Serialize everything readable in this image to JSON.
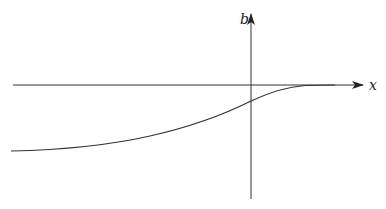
{
  "figure": {
    "axes": {
      "x_label": "x",
      "y_label": "b"
    },
    "curve": {
      "description": "monotonic increasing curve approaching zero from below as x increases",
      "color": "#333333"
    },
    "colors": {
      "line": "#333333",
      "background": "#ffffff"
    }
  }
}
